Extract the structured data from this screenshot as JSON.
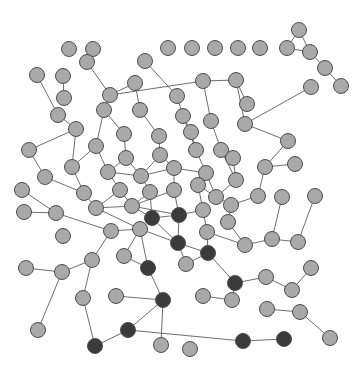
{
  "figure": {
    "type": "node-link-diagram",
    "width": 362,
    "height": 374,
    "background": "#ffffff"
  },
  "style": {
    "node_radius": 7.5,
    "node_light_fill": "#a9a9a9",
    "node_dark_fill": "#3b3b3b",
    "node_stroke": "#4d4d4d",
    "node_stroke_width": 1,
    "edge_stroke": "#6e6e6e",
    "edge_stroke_width": 1
  },
  "chart_data": {
    "type": "scatter",
    "xlabel": "",
    "ylabel": "",
    "grid": false,
    "legend": [
      {
        "label": "light node",
        "color": "#a9a9a9"
      },
      {
        "label": "dark node",
        "color": "#3b3b3b"
      }
    ],
    "node_count": 104,
    "edge_count": 112,
    "nodes": [
      {
        "id": 0,
        "x": 69,
        "y": 49,
        "group": "light"
      },
      {
        "id": 1,
        "x": 93,
        "y": 49,
        "group": "light"
      },
      {
        "id": 2,
        "x": 168,
        "y": 48,
        "group": "light"
      },
      {
        "id": 3,
        "x": 192,
        "y": 48,
        "group": "light"
      },
      {
        "id": 4,
        "x": 215,
        "y": 48,
        "group": "light"
      },
      {
        "id": 5,
        "x": 238,
        "y": 48,
        "group": "light"
      },
      {
        "id": 6,
        "x": 260,
        "y": 48,
        "group": "light"
      },
      {
        "id": 7,
        "x": 287,
        "y": 48,
        "group": "light"
      },
      {
        "id": 8,
        "x": 299,
        "y": 30,
        "group": "light"
      },
      {
        "id": 9,
        "x": 310,
        "y": 52,
        "group": "light"
      },
      {
        "id": 10,
        "x": 325,
        "y": 68,
        "group": "light"
      },
      {
        "id": 11,
        "x": 341,
        "y": 86,
        "group": "light"
      },
      {
        "id": 12,
        "x": 37,
        "y": 75,
        "group": "light"
      },
      {
        "id": 13,
        "x": 63,
        "y": 76,
        "group": "light"
      },
      {
        "id": 14,
        "x": 64,
        "y": 98,
        "group": "light"
      },
      {
        "id": 15,
        "x": 110,
        "y": 95,
        "group": "light"
      },
      {
        "id": 16,
        "x": 135,
        "y": 83,
        "group": "light"
      },
      {
        "id": 17,
        "x": 177,
        "y": 96,
        "group": "light"
      },
      {
        "id": 18,
        "x": 203,
        "y": 81,
        "group": "light"
      },
      {
        "id": 19,
        "x": 236,
        "y": 80,
        "group": "light"
      },
      {
        "id": 20,
        "x": 311,
        "y": 87,
        "group": "light"
      },
      {
        "id": 21,
        "x": 58,
        "y": 115,
        "group": "light"
      },
      {
        "id": 22,
        "x": 104,
        "y": 110,
        "group": "light"
      },
      {
        "id": 23,
        "x": 140,
        "y": 110,
        "group": "light"
      },
      {
        "id": 24,
        "x": 245,
        "y": 124,
        "group": "light"
      },
      {
        "id": 25,
        "x": 288,
        "y": 141,
        "group": "light"
      },
      {
        "id": 26,
        "x": 76,
        "y": 129,
        "group": "light"
      },
      {
        "id": 27,
        "x": 124,
        "y": 134,
        "group": "light"
      },
      {
        "id": 28,
        "x": 159,
        "y": 136,
        "group": "light"
      },
      {
        "id": 29,
        "x": 183,
        "y": 116,
        "group": "light"
      },
      {
        "id": 30,
        "x": 211,
        "y": 121,
        "group": "light"
      },
      {
        "id": 31,
        "x": 29,
        "y": 150,
        "group": "light"
      },
      {
        "id": 32,
        "x": 96,
        "y": 146,
        "group": "light"
      },
      {
        "id": 33,
        "x": 126,
        "y": 158,
        "group": "light"
      },
      {
        "id": 34,
        "x": 160,
        "y": 155,
        "group": "light"
      },
      {
        "id": 35,
        "x": 196,
        "y": 150,
        "group": "light"
      },
      {
        "id": 36,
        "x": 221,
        "y": 150,
        "group": "light"
      },
      {
        "id": 37,
        "x": 265,
        "y": 167,
        "group": "light"
      },
      {
        "id": 38,
        "x": 295,
        "y": 164,
        "group": "light"
      },
      {
        "id": 39,
        "x": 45,
        "y": 177,
        "group": "light"
      },
      {
        "id": 40,
        "x": 72,
        "y": 167,
        "group": "light"
      },
      {
        "id": 41,
        "x": 108,
        "y": 172,
        "group": "light"
      },
      {
        "id": 42,
        "x": 141,
        "y": 176,
        "group": "light"
      },
      {
        "id": 43,
        "x": 174,
        "y": 168,
        "group": "light"
      },
      {
        "id": 44,
        "x": 206,
        "y": 173,
        "group": "light"
      },
      {
        "id": 45,
        "x": 236,
        "y": 180,
        "group": "light"
      },
      {
        "id": 46,
        "x": 258,
        "y": 196,
        "group": "light"
      },
      {
        "id": 47,
        "x": 22,
        "y": 190,
        "group": "light"
      },
      {
        "id": 48,
        "x": 84,
        "y": 193,
        "group": "light"
      },
      {
        "id": 49,
        "x": 120,
        "y": 190,
        "group": "light"
      },
      {
        "id": 50,
        "x": 150,
        "y": 192,
        "group": "light"
      },
      {
        "id": 51,
        "x": 174,
        "y": 190,
        "group": "light"
      },
      {
        "id": 52,
        "x": 198,
        "y": 185,
        "group": "light"
      },
      {
        "id": 53,
        "x": 216,
        "y": 197,
        "group": "light"
      },
      {
        "id": 54,
        "x": 24,
        "y": 212,
        "group": "light"
      },
      {
        "id": 55,
        "x": 56,
        "y": 213,
        "group": "light"
      },
      {
        "id": 56,
        "x": 96,
        "y": 208,
        "group": "light"
      },
      {
        "id": 57,
        "x": 132,
        "y": 206,
        "group": "light"
      },
      {
        "id": 58,
        "x": 152,
        "y": 218,
        "group": "dark"
      },
      {
        "id": 59,
        "x": 179,
        "y": 215,
        "group": "dark"
      },
      {
        "id": 60,
        "x": 203,
        "y": 210,
        "group": "light"
      },
      {
        "id": 61,
        "x": 231,
        "y": 205,
        "group": "light"
      },
      {
        "id": 62,
        "x": 282,
        "y": 197,
        "group": "light"
      },
      {
        "id": 63,
        "x": 315,
        "y": 196,
        "group": "light"
      },
      {
        "id": 64,
        "x": 111,
        "y": 231,
        "group": "light"
      },
      {
        "id": 65,
        "x": 140,
        "y": 229,
        "group": "light"
      },
      {
        "id": 66,
        "x": 178,
        "y": 243,
        "group": "dark"
      },
      {
        "id": 67,
        "x": 207,
        "y": 232,
        "group": "light"
      },
      {
        "id": 68,
        "x": 228,
        "y": 222,
        "group": "light"
      },
      {
        "id": 69,
        "x": 245,
        "y": 245,
        "group": "light"
      },
      {
        "id": 70,
        "x": 272,
        "y": 239,
        "group": "light"
      },
      {
        "id": 71,
        "x": 298,
        "y": 242,
        "group": "light"
      },
      {
        "id": 72,
        "x": 26,
        "y": 268,
        "group": "light"
      },
      {
        "id": 73,
        "x": 62,
        "y": 272,
        "group": "light"
      },
      {
        "id": 74,
        "x": 92,
        "y": 260,
        "group": "light"
      },
      {
        "id": 75,
        "x": 124,
        "y": 256,
        "group": "light"
      },
      {
        "id": 76,
        "x": 148,
        "y": 268,
        "group": "dark"
      },
      {
        "id": 77,
        "x": 186,
        "y": 264,
        "group": "light"
      },
      {
        "id": 78,
        "x": 208,
        "y": 253,
        "group": "dark"
      },
      {
        "id": 79,
        "x": 235,
        "y": 283,
        "group": "dark"
      },
      {
        "id": 80,
        "x": 266,
        "y": 277,
        "group": "light"
      },
      {
        "id": 81,
        "x": 292,
        "y": 290,
        "group": "light"
      },
      {
        "id": 82,
        "x": 311,
        "y": 268,
        "group": "light"
      },
      {
        "id": 83,
        "x": 83,
        "y": 298,
        "group": "light"
      },
      {
        "id": 84,
        "x": 116,
        "y": 296,
        "group": "light"
      },
      {
        "id": 85,
        "x": 163,
        "y": 300,
        "group": "dark"
      },
      {
        "id": 86,
        "x": 203,
        "y": 296,
        "group": "light"
      },
      {
        "id": 87,
        "x": 232,
        "y": 300,
        "group": "light"
      },
      {
        "id": 88,
        "x": 267,
        "y": 309,
        "group": "light"
      },
      {
        "id": 89,
        "x": 300,
        "y": 312,
        "group": "light"
      },
      {
        "id": 90,
        "x": 38,
        "y": 330,
        "group": "light"
      },
      {
        "id": 91,
        "x": 95,
        "y": 346,
        "group": "dark"
      },
      {
        "id": 92,
        "x": 128,
        "y": 330,
        "group": "dark"
      },
      {
        "id": 93,
        "x": 161,
        "y": 345,
        "group": "light"
      },
      {
        "id": 94,
        "x": 190,
        "y": 349,
        "group": "light"
      },
      {
        "id": 95,
        "x": 243,
        "y": 341,
        "group": "dark"
      },
      {
        "id": 96,
        "x": 284,
        "y": 339,
        "group": "dark"
      },
      {
        "id": 97,
        "x": 330,
        "y": 338,
        "group": "light"
      },
      {
        "id": 98,
        "x": 233,
        "y": 158,
        "group": "light"
      },
      {
        "id": 99,
        "x": 191,
        "y": 132,
        "group": "light"
      },
      {
        "id": 100,
        "x": 247,
        "y": 104,
        "group": "light"
      },
      {
        "id": 101,
        "x": 145,
        "y": 61,
        "group": "light"
      },
      {
        "id": 102,
        "x": 87,
        "y": 62,
        "group": "light"
      },
      {
        "id": 103,
        "x": 63,
        "y": 236,
        "group": "light"
      }
    ],
    "edges": [
      [
        8,
        7
      ],
      [
        8,
        9
      ],
      [
        7,
        9
      ],
      [
        9,
        10
      ],
      [
        10,
        11
      ],
      [
        12,
        21
      ],
      [
        21,
        26
      ],
      [
        26,
        31
      ],
      [
        26,
        40
      ],
      [
        31,
        39
      ],
      [
        13,
        14
      ],
      [
        102,
        15
      ],
      [
        15,
        22
      ],
      [
        15,
        16
      ],
      [
        16,
        23
      ],
      [
        101,
        17
      ],
      [
        17,
        29
      ],
      [
        18,
        15
      ],
      [
        18,
        30
      ],
      [
        19,
        18
      ],
      [
        19,
        24
      ],
      [
        24,
        25
      ],
      [
        25,
        37
      ],
      [
        20,
        24
      ],
      [
        22,
        27
      ],
      [
        22,
        32
      ],
      [
        23,
        28
      ],
      [
        27,
        33
      ],
      [
        28,
        34
      ],
      [
        29,
        35
      ],
      [
        30,
        36
      ],
      [
        32,
        41
      ],
      [
        33,
        42
      ],
      [
        34,
        43
      ],
      [
        35,
        44
      ],
      [
        36,
        45
      ],
      [
        37,
        46
      ],
      [
        38,
        37
      ],
      [
        39,
        48
      ],
      [
        40,
        48
      ],
      [
        41,
        49
      ],
      [
        42,
        50
      ],
      [
        43,
        51
      ],
      [
        44,
        52
      ],
      [
        45,
        53
      ],
      [
        46,
        61
      ],
      [
        47,
        55
      ],
      [
        48,
        56
      ],
      [
        49,
        57
      ],
      [
        50,
        58
      ],
      [
        51,
        59
      ],
      [
        52,
        60
      ],
      [
        53,
        61
      ],
      [
        54,
        55
      ],
      [
        55,
        64
      ],
      [
        56,
        65
      ],
      [
        57,
        58
      ],
      [
        58,
        66
      ],
      [
        59,
        66
      ],
      [
        60,
        67
      ],
      [
        61,
        68
      ],
      [
        62,
        70
      ],
      [
        63,
        71
      ],
      [
        64,
        74
      ],
      [
        65,
        76
      ],
      [
        66,
        78
      ],
      [
        67,
        69
      ],
      [
        68,
        69
      ],
      [
        69,
        70
      ],
      [
        70,
        71
      ],
      [
        72,
        73
      ],
      [
        73,
        74
      ],
      [
        73,
        90
      ],
      [
        74,
        83
      ],
      [
        75,
        76
      ],
      [
        76,
        85
      ],
      [
        77,
        78
      ],
      [
        78,
        79
      ],
      [
        79,
        80
      ],
      [
        79,
        87
      ],
      [
        80,
        81
      ],
      [
        81,
        82
      ],
      [
        83,
        91
      ],
      [
        84,
        85
      ],
      [
        85,
        93
      ],
      [
        85,
        92
      ],
      [
        86,
        87
      ],
      [
        88,
        89
      ],
      [
        91,
        92
      ],
      [
        92,
        95
      ],
      [
        95,
        96
      ],
      [
        89,
        97
      ],
      [
        99,
        29
      ],
      [
        99,
        35
      ],
      [
        98,
        36
      ],
      [
        98,
        45
      ],
      [
        100,
        19
      ],
      [
        41,
        42
      ],
      [
        42,
        43
      ],
      [
        34,
        42
      ],
      [
        50,
        57
      ],
      [
        51,
        57
      ],
      [
        57,
        59
      ],
      [
        58,
        59
      ],
      [
        59,
        60
      ],
      [
        49,
        56
      ],
      [
        56,
        57
      ],
      [
        44,
        53
      ],
      [
        52,
        53
      ],
      [
        43,
        44
      ],
      [
        33,
        41
      ],
      [
        32,
        40
      ],
      [
        65,
        66
      ],
      [
        64,
        65
      ],
      [
        75,
        65
      ],
      [
        77,
        66
      ],
      [
        67,
        78
      ]
    ]
  }
}
